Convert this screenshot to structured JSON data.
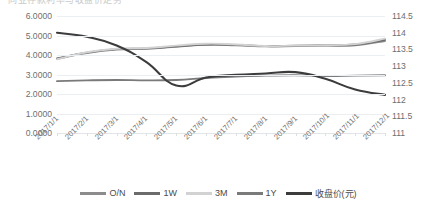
{
  "title": {
    "text": "同业存款利率与收盘价走势"
  },
  "axes": {
    "left": {
      "ticks": [
        "6.0000",
        "5.0000",
        "4.0000",
        "3.0000",
        "2.0000",
        "1.0000",
        "0.0000"
      ],
      "min": 0,
      "max": 6
    },
    "right": {
      "ticks": [
        "114.5",
        "114",
        "113.5",
        "113",
        "112.5",
        "112",
        "111.5",
        "111"
      ],
      "min": 111,
      "max": 114.5
    },
    "x": {
      "ticks": [
        "2017/1/1",
        "2017/2/1",
        "2017/3/1",
        "2017/4/1",
        "2017/5/1",
        "2017/6/1",
        "2017/7/1",
        "2017/8/1",
        "2017/9/1",
        "2017/10/1",
        "2017/11/1",
        "2017/12/1"
      ]
    }
  },
  "legend": {
    "position": "bottom",
    "items": [
      {
        "label": "O/N",
        "color": "#8c8c8c"
      },
      {
        "label": "1W",
        "color": "#6b6b6b"
      },
      {
        "label": "3M",
        "color": "#d2d2d2"
      },
      {
        "label": "1Y",
        "color": "#7a7a7a"
      },
      {
        "label": "收盘价(元)",
        "color": "#3c3c3c"
      }
    ]
  },
  "chart_data": {
    "type": "line",
    "title": "同业存款利率与收盘价走势",
    "xlabel": "",
    "ylabel": "",
    "grid": true,
    "legend_position": "bottom",
    "categories": [
      "2017/1/1",
      "2017/2/1",
      "2017/3/1",
      "2017/4/1",
      "2017/5/1",
      "2017/6/1",
      "2017/7/1",
      "2017/8/1",
      "2017/9/1",
      "2017/10/1",
      "2017/11/1",
      "2017/12/1"
    ],
    "ylim": [
      0,
      6
    ],
    "y2lim": [
      111,
      114.5
    ],
    "series": [
      {
        "name": "O/N",
        "axis": "left",
        "color": "#8c8c8c",
        "values": [
          3.8,
          4.1,
          4.28,
          4.32,
          4.42,
          4.52,
          4.5,
          4.44,
          4.46,
          4.48,
          4.5,
          4.72
        ]
      },
      {
        "name": "1W",
        "axis": "left",
        "color": "#6b6b6b",
        "values": [
          3.82,
          4.12,
          4.3,
          4.34,
          4.44,
          4.54,
          4.52,
          4.46,
          4.48,
          4.5,
          4.54,
          4.78
        ]
      },
      {
        "name": "3M",
        "axis": "left",
        "color": "#d2d2d2",
        "values": [
          3.78,
          4.14,
          4.32,
          4.36,
          4.48,
          4.58,
          4.54,
          4.46,
          4.48,
          4.5,
          4.56,
          4.84
        ]
      },
      {
        "name": "1Y",
        "axis": "left",
        "color": "#7a7a7a",
        "values": [
          2.66,
          2.7,
          2.72,
          2.7,
          2.72,
          2.82,
          2.9,
          2.94,
          2.96,
          2.92,
          2.94,
          2.96
        ]
      },
      {
        "name": "收盘价(元)",
        "axis": "right",
        "color": "#3c3c3c",
        "values": [
          114.0,
          113.88,
          113.62,
          113.12,
          112.42,
          112.66,
          112.74,
          112.78,
          112.82,
          112.62,
          112.3,
          112.14
        ]
      }
    ]
  }
}
